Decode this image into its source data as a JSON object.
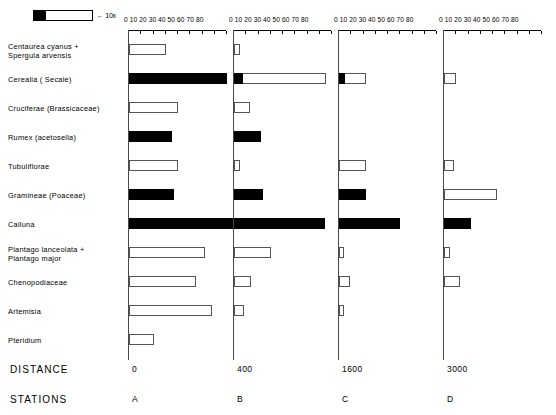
{
  "legend": {
    "label": "← 10x",
    "black_swatch": "black-segment",
    "white_swatch": "white-segment-10x"
  },
  "axis": {
    "ticklabels": "0 10 20 30 40 50 60 70 80",
    "ticks": [
      0,
      10,
      20,
      30,
      40,
      50,
      60,
      70,
      80
    ],
    "max": 80
  },
  "footer": {
    "distance_label": "DISTANCE",
    "stations_label": "STATIONS"
  },
  "stations": [
    {
      "id": "A",
      "distance": "0"
    },
    {
      "id": "B",
      "distance": "400"
    },
    {
      "id": "C",
      "distance": "1600"
    },
    {
      "id": "D",
      "distance": "3000"
    }
  ],
  "taxa": [
    {
      "name": "Centaurea cyanus +\nSpergula arvensis",
      "line1": "Centaurea  cyanus +",
      "line2": "Spergula  arvensis"
    },
    {
      "name": "Cerealia  ( Secale)",
      "line1": "Cerealia   ( Secale)",
      "line2": ""
    },
    {
      "name": "Cruciferae (Brassicaceae)",
      "line1": "Cruciferae  (Brassicaceae)",
      "line2": ""
    },
    {
      "name": "Rumex (acetosella)",
      "line1": "Rumex (acetosella)",
      "line2": ""
    },
    {
      "name": "Tubuliflorae",
      "line1": "Tubuliflorae",
      "line2": ""
    },
    {
      "name": "Gramineae (Poaceae)",
      "line1": "Gramineae (Poaceae)",
      "line2": ""
    },
    {
      "name": "Calluna",
      "line1": "Calluna",
      "line2": ""
    },
    {
      "name": "Plantago lanceolata +\nPlantago major",
      "line1": "Plantago  lanceolata +",
      "line2": "Plantago  major"
    },
    {
      "name": "Chenopodiaceae",
      "line1": "Chenopodiaceae",
      "line2": ""
    },
    {
      "name": "Artemisia",
      "line1": "Artemisia",
      "line2": ""
    },
    {
      "name": "Pteridium",
      "line1": "Pteridium",
      "line2": ""
    }
  ],
  "chart_data": {
    "type": "bar",
    "orientation": "horizontal",
    "xlabel": "",
    "ylabel": "",
    "xlim": [
      0,
      80
    ],
    "ticks": [
      0,
      10,
      20,
      30,
      40,
      50,
      60,
      70,
      80
    ],
    "grid": false,
    "legend": "black = actual percentage, white (open) = value exaggerated 10x",
    "categories": [
      "Centaurea cyanus + Spergula arvensis",
      "Cerealia ( Secale)",
      "Cruciferae (Brassicaceae)",
      "Rumex (acetosella)",
      "Tubuliflorae",
      "Gramineae (Poaceae)",
      "Calluna",
      "Plantago lanceolata + Plantago major",
      "Chenopodiaceae",
      "Artemisia",
      "Pteridium"
    ],
    "series": [
      {
        "name": "A",
        "distance": 0,
        "values": [
          30,
          80,
          40,
          35,
          40,
          37,
          95,
          62,
          55,
          68,
          20
        ],
        "fill": [
          "white",
          "black",
          "white",
          "black",
          "white",
          "black",
          "black",
          "white",
          "white",
          "white",
          "white"
        ],
        "black_prefix": [
          0,
          80,
          0,
          35,
          0,
          37,
          95,
          0,
          0,
          0,
          0
        ]
      },
      {
        "name": "B",
        "distance": 400,
        "values": [
          5,
          75,
          13,
          22,
          5,
          24,
          74,
          30,
          14,
          8,
          0
        ],
        "fill": [
          "white",
          "white",
          "white",
          "black",
          "white",
          "black",
          "black",
          "white",
          "white",
          "white",
          "none"
        ],
        "black_prefix": [
          0,
          7,
          0,
          22,
          0,
          24,
          74,
          0,
          0,
          0,
          0
        ]
      },
      {
        "name": "C",
        "distance": 1600,
        "values": [
          0,
          22,
          0,
          0,
          22,
          22,
          50,
          4,
          9,
          4,
          0
        ],
        "fill": [
          "none",
          "white",
          "none",
          "none",
          "white",
          "black",
          "black",
          "white",
          "white",
          "white",
          "none"
        ],
        "black_prefix": [
          0,
          5,
          0,
          0,
          0,
          22,
          50,
          0,
          0,
          0,
          0
        ]
      },
      {
        "name": "D",
        "distance": 3000,
        "values": [
          0,
          10,
          0,
          0,
          8,
          43,
          22,
          5,
          13,
          0,
          0
        ],
        "fill": [
          "none",
          "white",
          "none",
          "none",
          "white",
          "white",
          "black",
          "white",
          "white",
          "none",
          "none"
        ],
        "black_prefix": [
          0,
          0,
          0,
          0,
          0,
          0,
          22,
          0,
          0,
          0,
          0
        ]
      }
    ]
  }
}
